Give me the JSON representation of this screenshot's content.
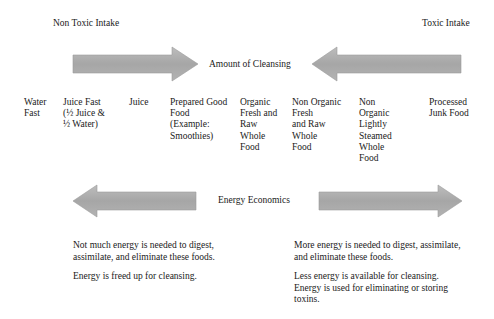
{
  "header": {
    "left_label": "Non Toxic Intake",
    "right_label": "Toxic Intake"
  },
  "cleansing": {
    "label": "Amount of Cleansing"
  },
  "spectrum": [
    {
      "label": "Water\nFast"
    },
    {
      "label": "Juice Fast\n(½  Juice &\n½ Water)"
    },
    {
      "label": "Juice"
    },
    {
      "label": "Prepared Good\nFood\n(Example:\nSmoothies)"
    },
    {
      "label": "Organic\nFresh and\nRaw\nWhole\nFood"
    },
    {
      "label": "Non Organic\nFresh\nand Raw\nWhole\nFood"
    },
    {
      "label": "Non\nOrganic\nLightly\nSteamed\nWhole\nFood"
    },
    {
      "label": "Processed\nJunk Food"
    }
  ],
  "energy": {
    "label": "Energy Economics"
  },
  "left_notes": [
    "Not much energy is needed to digest, assimilate, and eliminate these foods.",
    "Energy is freed up for cleansing."
  ],
  "right_notes": [
    "More energy is needed to digest, assimilate, and eliminate these foods.",
    "Less energy is available for cleansing. Energy is used for eliminating or storing toxins."
  ],
  "colors": {
    "arrow_fill": "#a9a9a9",
    "arrow_edge": "#8f8f8f",
    "text": "#1a1a1a"
  }
}
